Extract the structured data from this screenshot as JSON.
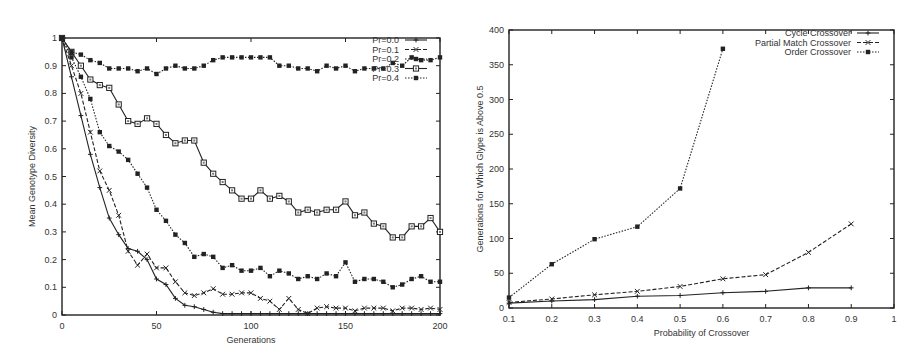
{
  "chart_data": [
    {
      "type": "line",
      "title": "",
      "xlabel": "Generations",
      "ylabel": "Mean Genotype Diversity",
      "xlim": [
        0,
        200
      ],
      "ylim": [
        0,
        1
      ],
      "xticks": [
        "0",
        "50",
        "100",
        "150",
        "200"
      ],
      "yticks": [
        "0",
        "0.1",
        "0.2",
        "0.3",
        "0.4",
        "0.5",
        "0.6",
        "0.7",
        "0.8",
        "0.9",
        "1"
      ],
      "grid": false,
      "legend_position": "top-right",
      "x": [
        0,
        5,
        10,
        15,
        20,
        25,
        30,
        35,
        40,
        45,
        50,
        55,
        60,
        65,
        70,
        75,
        80,
        85,
        90,
        95,
        100,
        105,
        110,
        115,
        120,
        125,
        130,
        135,
        140,
        145,
        150,
        155,
        160,
        165,
        170,
        175,
        180,
        185,
        190,
        195,
        200
      ],
      "series": [
        {
          "name": "Pr=0.0",
          "marker": "plus",
          "dash": "solid",
          "values": [
            1.0,
            0.86,
            0.72,
            0.58,
            0.46,
            0.35,
            0.29,
            0.24,
            0.23,
            0.2,
            0.13,
            0.11,
            0.06,
            0.035,
            0.03,
            0.02,
            0.01,
            0.005,
            0.005,
            0.005,
            0.005,
            0.005,
            0.005,
            0.005,
            0.005,
            0.005,
            0.005,
            0.005,
            0.005,
            0.005,
            0.005,
            0.005,
            0.005,
            0.005,
            0.005,
            0.005,
            0.005,
            0.005,
            0.005,
            0.005,
            0.005
          ]
        },
        {
          "name": "Pr=0.1",
          "marker": "cross",
          "dash": "dashed",
          "values": [
            1.0,
            0.9,
            0.8,
            0.66,
            0.52,
            0.45,
            0.36,
            0.23,
            0.18,
            0.22,
            0.17,
            0.17,
            0.12,
            0.08,
            0.07,
            0.08,
            0.095,
            0.075,
            0.075,
            0.08,
            0.08,
            0.06,
            0.05,
            0.02,
            0.06,
            0.02,
            0.005,
            0.025,
            0.03,
            0.025,
            0.025,
            0.015,
            0.025,
            0.025,
            0.025,
            0.015,
            0.025,
            0.025,
            0.02,
            0.025,
            0.02
          ]
        },
        {
          "name": "Pr=0.2",
          "marker": "filled-square",
          "dash": "dotted",
          "values": [
            1.0,
            0.93,
            0.86,
            0.78,
            0.66,
            0.61,
            0.59,
            0.56,
            0.51,
            0.46,
            0.38,
            0.34,
            0.29,
            0.26,
            0.21,
            0.22,
            0.21,
            0.17,
            0.18,
            0.16,
            0.16,
            0.17,
            0.14,
            0.16,
            0.15,
            0.13,
            0.14,
            0.13,
            0.15,
            0.14,
            0.19,
            0.12,
            0.13,
            0.13,
            0.12,
            0.1,
            0.11,
            0.13,
            0.14,
            0.12,
            0.12
          ]
        },
        {
          "name": "Pr=0.3",
          "marker": "open-square",
          "dash": "solid",
          "values": [
            1.0,
            0.95,
            0.9,
            0.85,
            0.83,
            0.82,
            0.76,
            0.7,
            0.69,
            0.71,
            0.69,
            0.65,
            0.62,
            0.63,
            0.63,
            0.55,
            0.51,
            0.48,
            0.45,
            0.42,
            0.42,
            0.45,
            0.42,
            0.43,
            0.41,
            0.37,
            0.38,
            0.37,
            0.38,
            0.38,
            0.41,
            0.36,
            0.37,
            0.33,
            0.32,
            0.28,
            0.28,
            0.32,
            0.32,
            0.35,
            0.3
          ]
        },
        {
          "name": "Pr=0.4",
          "marker": "filled-square",
          "dash": "dotted",
          "values": [
            1.0,
            0.95,
            0.94,
            0.92,
            0.91,
            0.89,
            0.89,
            0.89,
            0.88,
            0.89,
            0.87,
            0.89,
            0.9,
            0.89,
            0.89,
            0.9,
            0.92,
            0.93,
            0.93,
            0.93,
            0.93,
            0.93,
            0.93,
            0.9,
            0.9,
            0.89,
            0.89,
            0.88,
            0.9,
            0.89,
            0.9,
            0.88,
            0.89,
            0.89,
            0.89,
            0.91,
            0.9,
            0.93,
            0.92,
            0.92,
            0.93
          ]
        }
      ]
    },
    {
      "type": "line",
      "title": "",
      "xlabel": "Probability of Crossover",
      "ylabel": "Generations for Which Glype is Above 0.5",
      "xlim": [
        0.1,
        1.0
      ],
      "ylim": [
        0,
        400
      ],
      "xticks": [
        "0.1",
        "0.2",
        "0.3",
        "0.4",
        "0.5",
        "0.6",
        "0.7",
        "0.8",
        "0.9",
        "1"
      ],
      "yticks": [
        "0",
        "50",
        "100",
        "150",
        "200",
        "250",
        "300",
        "350",
        "400"
      ],
      "grid": false,
      "legend_position": "top-right",
      "series": [
        {
          "name": "Cycle Crossover",
          "marker": "plus",
          "dash": "solid",
          "x": [
            0.1,
            0.2,
            0.3,
            0.4,
            0.5,
            0.6,
            0.7,
            0.8,
            0.9
          ],
          "values": [
            7,
            10,
            12,
            17,
            18,
            22,
            24,
            29,
            29
          ]
        },
        {
          "name": "Partial Match Crossover",
          "marker": "cross",
          "dash": "dashed",
          "x": [
            0.1,
            0.2,
            0.3,
            0.4,
            0.5,
            0.6,
            0.7,
            0.8,
            0.9
          ],
          "values": [
            8,
            13,
            19,
            24,
            31,
            42,
            48,
            80,
            121
          ]
        },
        {
          "name": "Order Crossover",
          "marker": "filled-square",
          "dash": "dotted",
          "x": [
            0.1,
            0.2,
            0.3,
            0.4,
            0.5,
            0.6
          ],
          "values": [
            15,
            63,
            99,
            117,
            172,
            373
          ]
        }
      ]
    }
  ],
  "left": {
    "xlabel": "Generations",
    "ylabel": "Mean Genotype Diversity",
    "legend": [
      "Pr=0.0",
      "Pr=0.1",
      "Pr=0.2",
      "Pr=0.3",
      "Pr=0.4"
    ]
  },
  "right": {
    "xlabel": "Probability of Crossover",
    "ylabel": "Generations for Which Glype is Above 0.5",
    "legend": [
      "Cycle Crossover",
      "Partial Match Crossover",
      "Order Crossover"
    ]
  }
}
